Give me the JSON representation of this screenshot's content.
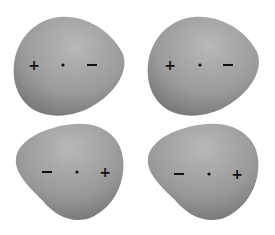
{
  "figure": {
    "panels": [
      {
        "id": "top-left",
        "orientation": "narrow-right",
        "symbols": [
          "+",
          "•",
          "−"
        ]
      },
      {
        "id": "top-right",
        "orientation": "narrow-right",
        "symbols": [
          "+",
          "•",
          "−"
        ]
      },
      {
        "id": "bottom-left",
        "orientation": "narrow-left-bottom",
        "symbols": [
          "−",
          "•",
          "+"
        ]
      },
      {
        "id": "bottom-right",
        "orientation": "narrow-left-bottom",
        "symbols": [
          "−",
          "•",
          "+"
        ]
      }
    ],
    "colors": {
      "shape_light": "#bdbdbd",
      "shape_dark": "#7a7a7a",
      "symbol": "#111111"
    }
  }
}
